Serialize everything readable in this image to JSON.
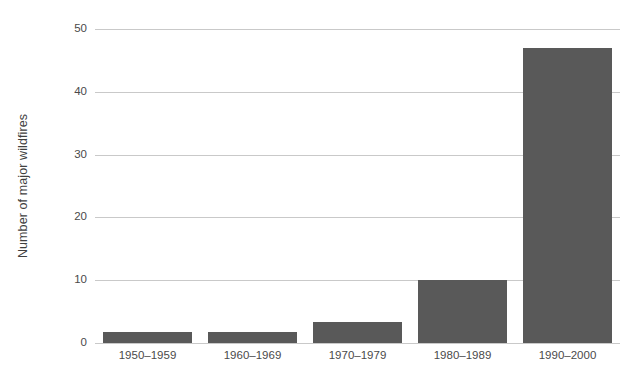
{
  "chart_data": {
    "type": "bar",
    "title": "",
    "subtitle": "",
    "xlabel": "",
    "ylabel": "Number of major wildfires",
    "categories": [
      "1950–1959",
      "1960–1969",
      "1970–1979",
      "1980–1989",
      "1990–2000"
    ],
    "values": [
      1.8,
      1.8,
      3.4,
      10,
      47
    ],
    "series": [
      {
        "name": "Number of major wildfires",
        "values": [
          1.8,
          1.8,
          3.4,
          10,
          47
        ]
      }
    ],
    "ylim": [
      0,
      50
    ],
    "yticks": [
      0,
      10,
      20,
      30,
      40,
      50
    ],
    "ytick_labels": [
      "0",
      "10",
      "20",
      "30",
      "40",
      "50"
    ],
    "grid": true,
    "grid_axis": "y",
    "legend": false,
    "legend_position": "none",
    "colors": {
      "bar": "#595959",
      "gridline": "#c9c9c9",
      "background": "#ffffff",
      "text": "#4a4a4a",
      "axis_title": "#3f3f3f"
    }
  }
}
